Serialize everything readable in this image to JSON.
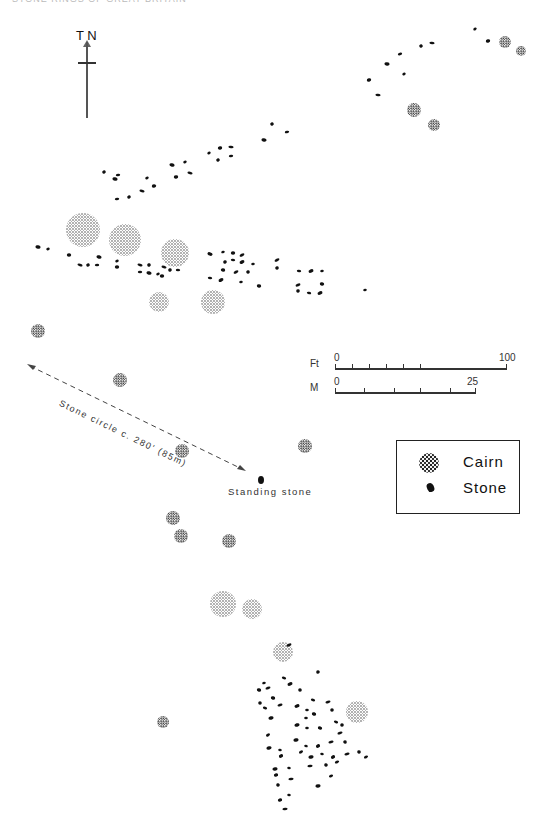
{
  "header": {
    "text": "STONE RINGS OF GREAT BRITAIN"
  },
  "north_arrow": {
    "label": "T N",
    "icon": "north-arrow-icon"
  },
  "scale_bars": [
    {
      "unit": "Ft",
      "start": "0",
      "end": "100",
      "ticks": 5
    },
    {
      "unit": "M",
      "start": "0",
      "end": "25",
      "ticks": 4
    }
  ],
  "legend": {
    "items": [
      {
        "symbol": "cairn",
        "label": "Cairn"
      },
      {
        "symbol": "stone",
        "label": "Stone"
      }
    ]
  },
  "annotations": {
    "stone_circle": "Stone circle c. 280' (85m)",
    "standing_stone": "Standing stone"
  },
  "colors": {
    "ink": "#111111",
    "paper": "#ffffff",
    "stipple": "#333333"
  },
  "cairns": [
    {
      "x": 505,
      "y": 42,
      "r": 6
    },
    {
      "x": 521,
      "y": 51,
      "r": 5
    },
    {
      "x": 414,
      "y": 110,
      "r": 7
    },
    {
      "x": 434,
      "y": 125,
      "r": 6
    },
    {
      "x": 83,
      "y": 230,
      "r": 17
    },
    {
      "x": 125,
      "y": 240,
      "r": 16
    },
    {
      "x": 175,
      "y": 253,
      "r": 14
    },
    {
      "x": 159,
      "y": 302,
      "r": 10
    },
    {
      "x": 213,
      "y": 302,
      "r": 12
    },
    {
      "x": 38,
      "y": 331,
      "r": 7
    },
    {
      "x": 120,
      "y": 380,
      "r": 7
    },
    {
      "x": 182,
      "y": 451,
      "r": 7
    },
    {
      "x": 305,
      "y": 446,
      "r": 7
    },
    {
      "x": 173,
      "y": 518,
      "r": 7
    },
    {
      "x": 181,
      "y": 536,
      "r": 7
    },
    {
      "x": 229,
      "y": 541,
      "r": 7
    },
    {
      "x": 223,
      "y": 604,
      "r": 13
    },
    {
      "x": 252,
      "y": 609,
      "r": 10
    },
    {
      "x": 283,
      "y": 652,
      "r": 10
    },
    {
      "x": 357,
      "y": 712,
      "r": 11
    },
    {
      "x": 163,
      "y": 722,
      "r": 6
    }
  ],
  "stones": [
    {
      "x": 475,
      "y": 29
    },
    {
      "x": 488,
      "y": 41
    },
    {
      "x": 432,
      "y": 43
    },
    {
      "x": 421,
      "y": 46
    },
    {
      "x": 400,
      "y": 54
    },
    {
      "x": 387,
      "y": 64
    },
    {
      "x": 404,
      "y": 74
    },
    {
      "x": 369,
      "y": 80
    },
    {
      "x": 378,
      "y": 95
    },
    {
      "x": 272,
      "y": 124
    },
    {
      "x": 287,
      "y": 132
    },
    {
      "x": 264,
      "y": 140
    },
    {
      "x": 209,
      "y": 153
    },
    {
      "x": 220,
      "y": 148
    },
    {
      "x": 231,
      "y": 147
    },
    {
      "x": 218,
      "y": 160
    },
    {
      "x": 231,
      "y": 156
    },
    {
      "x": 172,
      "y": 165
    },
    {
      "x": 185,
      "y": 162
    },
    {
      "x": 176,
      "y": 177
    },
    {
      "x": 190,
      "y": 173
    },
    {
      "x": 104,
      "y": 172
    },
    {
      "x": 118,
      "y": 175
    },
    {
      "x": 115,
      "y": 179
    },
    {
      "x": 147,
      "y": 178
    },
    {
      "x": 154,
      "y": 186
    },
    {
      "x": 142,
      "y": 191
    },
    {
      "x": 129,
      "y": 197
    },
    {
      "x": 117,
      "y": 199
    },
    {
      "x": 38,
      "y": 247
    },
    {
      "x": 48,
      "y": 249
    },
    {
      "x": 69,
      "y": 255
    },
    {
      "x": 80,
      "y": 265
    },
    {
      "x": 88,
      "y": 265
    },
    {
      "x": 97,
      "y": 265
    },
    {
      "x": 99,
      "y": 257
    },
    {
      "x": 117,
      "y": 261
    },
    {
      "x": 117,
      "y": 267
    },
    {
      "x": 140,
      "y": 265
    },
    {
      "x": 149,
      "y": 265
    },
    {
      "x": 140,
      "y": 272
    },
    {
      "x": 149,
      "y": 273
    },
    {
      "x": 158,
      "y": 274
    },
    {
      "x": 162,
      "y": 276
    },
    {
      "x": 164,
      "y": 267
    },
    {
      "x": 170,
      "y": 270
    },
    {
      "x": 178,
      "y": 270
    },
    {
      "x": 210,
      "y": 254
    },
    {
      "x": 223,
      "y": 252
    },
    {
      "x": 233,
      "y": 253
    },
    {
      "x": 242,
      "y": 255
    },
    {
      "x": 225,
      "y": 262
    },
    {
      "x": 233,
      "y": 260
    },
    {
      "x": 242,
      "y": 262
    },
    {
      "x": 253,
      "y": 264
    },
    {
      "x": 223,
      "y": 270
    },
    {
      "x": 236,
      "y": 272
    },
    {
      "x": 248,
      "y": 272
    },
    {
      "x": 210,
      "y": 278
    },
    {
      "x": 221,
      "y": 280
    },
    {
      "x": 241,
      "y": 282
    },
    {
      "x": 259,
      "y": 286
    },
    {
      "x": 277,
      "y": 260
    },
    {
      "x": 277,
      "y": 268
    },
    {
      "x": 299,
      "y": 271
    },
    {
      "x": 311,
      "y": 271
    },
    {
      "x": 322,
      "y": 271
    },
    {
      "x": 322,
      "y": 284
    },
    {
      "x": 298,
      "y": 285
    },
    {
      "x": 298,
      "y": 291
    },
    {
      "x": 309,
      "y": 293
    },
    {
      "x": 320,
      "y": 293
    },
    {
      "x": 365,
      "y": 290
    },
    {
      "x": 261,
      "y": 480
    },
    {
      "x": 289,
      "y": 645
    },
    {
      "x": 318,
      "y": 672
    },
    {
      "x": 284,
      "y": 678
    },
    {
      "x": 290,
      "y": 684
    },
    {
      "x": 264,
      "y": 683
    },
    {
      "x": 259,
      "y": 690
    },
    {
      "x": 268,
      "y": 688
    },
    {
      "x": 300,
      "y": 690
    },
    {
      "x": 313,
      "y": 700
    },
    {
      "x": 297,
      "y": 706
    },
    {
      "x": 307,
      "y": 710
    },
    {
      "x": 273,
      "y": 698
    },
    {
      "x": 280,
      "y": 705
    },
    {
      "x": 260,
      "y": 703
    },
    {
      "x": 265,
      "y": 708
    },
    {
      "x": 271,
      "y": 718
    },
    {
      "x": 306,
      "y": 718
    },
    {
      "x": 314,
      "y": 714
    },
    {
      "x": 328,
      "y": 702
    },
    {
      "x": 332,
      "y": 710
    },
    {
      "x": 336,
      "y": 722
    },
    {
      "x": 297,
      "y": 725
    },
    {
      "x": 307,
      "y": 728
    },
    {
      "x": 320,
      "y": 728
    },
    {
      "x": 340,
      "y": 733
    },
    {
      "x": 342,
      "y": 725
    },
    {
      "x": 268,
      "y": 735
    },
    {
      "x": 296,
      "y": 740
    },
    {
      "x": 306,
      "y": 746
    },
    {
      "x": 318,
      "y": 746
    },
    {
      "x": 331,
      "y": 742
    },
    {
      "x": 345,
      "y": 742
    },
    {
      "x": 301,
      "y": 752
    },
    {
      "x": 311,
      "y": 757
    },
    {
      "x": 322,
      "y": 754
    },
    {
      "x": 333,
      "y": 757
    },
    {
      "x": 347,
      "y": 754
    },
    {
      "x": 359,
      "y": 752
    },
    {
      "x": 366,
      "y": 757
    },
    {
      "x": 269,
      "y": 748
    },
    {
      "x": 280,
      "y": 750
    },
    {
      "x": 281,
      "y": 756
    },
    {
      "x": 310,
      "y": 766
    },
    {
      "x": 326,
      "y": 765
    },
    {
      "x": 337,
      "y": 762
    },
    {
      "x": 275,
      "y": 769
    },
    {
      "x": 289,
      "y": 768
    },
    {
      "x": 276,
      "y": 775
    },
    {
      "x": 291,
      "y": 779
    },
    {
      "x": 278,
      "y": 785
    },
    {
      "x": 331,
      "y": 776
    },
    {
      "x": 318,
      "y": 786
    },
    {
      "x": 289,
      "y": 795
    },
    {
      "x": 280,
      "y": 800
    },
    {
      "x": 285,
      "y": 809
    }
  ]
}
